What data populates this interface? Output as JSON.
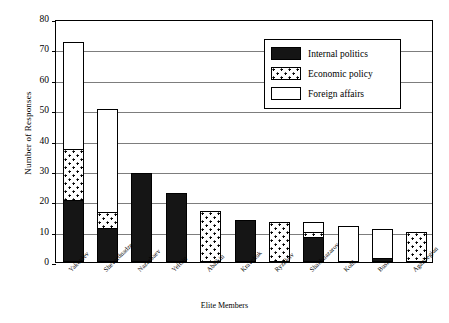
{
  "chart_data": {
    "type": "bar",
    "subtype": "stacked-vertical",
    "title": "",
    "xlabel": "Elite Members",
    "ylabel": "Number of Responses",
    "ylim": [
      0,
      80
    ],
    "yticks": [
      0,
      10,
      20,
      30,
      40,
      50,
      60,
      70,
      80
    ],
    "grid": true,
    "legend_position": "top-right-inside",
    "categories": [
      "Yakovlev",
      "Shevardnadze",
      "Nazarbaev",
      "Yeltsin",
      "Abalkin",
      "Kravchuk",
      "Ryzhkov",
      "Shakhnazarov",
      "Kohl",
      "Bush",
      "Aganbegian"
    ],
    "series": [
      {
        "name": "Internal politics",
        "fill": "solid-black",
        "color": "#151515",
        "values": [
          20,
          11,
          29,
          22.5,
          0,
          13.5,
          0,
          8,
          0,
          1,
          0
        ]
      },
      {
        "name": "Economic policy",
        "fill": "dotted",
        "color": "#ffffff",
        "values": [
          17,
          5,
          0,
          0,
          16.5,
          0,
          13,
          1.5,
          0,
          0,
          9.5
        ]
      },
      {
        "name": "Foreign affairs",
        "fill": "white",
        "color": "#ffffff",
        "values": [
          35,
          34,
          0,
          0,
          0,
          0,
          0,
          3.5,
          11.5,
          9.5,
          0
        ]
      }
    ],
    "totals": [
      72,
      50,
      29,
      22.5,
      16.5,
      13.5,
      13,
      13,
      11.5,
      10.5,
      9.5
    ]
  },
  "legend": {
    "items": [
      {
        "label": "Internal politics",
        "swatch": "solid-black-swatch"
      },
      {
        "label": "Economic policy",
        "swatch": "dotted-swatch"
      },
      {
        "label": "Foreign affairs",
        "swatch": "white-swatch"
      }
    ]
  },
  "axes": {
    "y_title": "Number of Responses",
    "x_title": "Elite Members",
    "y_tick_labels": [
      "0",
      "10",
      "20",
      "30",
      "40",
      "50",
      "60",
      "70",
      "80"
    ]
  }
}
